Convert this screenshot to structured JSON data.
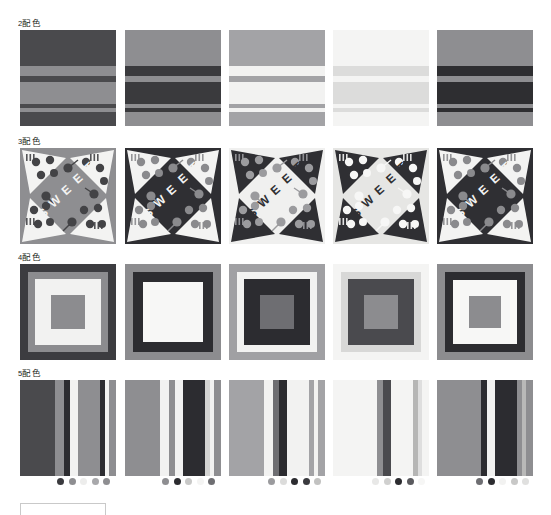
{
  "page": {
    "background": "#ffffff",
    "width": 551,
    "height": 515
  },
  "rows": [
    {
      "id": "row-2colors",
      "label": "2配色",
      "label_number": "2",
      "label_text": "配色",
      "pattern": "horizontal-stripes",
      "top": 18,
      "swatches": [
        {
          "name": "swatch-2c-1",
          "left": 20,
          "palette": [
            "#4a4a4d",
            "#8e8e91"
          ],
          "bands": [
            {
              "top": 0,
              "height": 36,
              "color": "#4a4a4d"
            },
            {
              "top": 36,
              "height": 10,
              "color": "#8e8e91"
            },
            {
              "top": 46,
              "height": 6,
              "color": "#4a4a4d"
            },
            {
              "top": 52,
              "height": 22,
              "color": "#8e8e91"
            },
            {
              "top": 74,
              "height": 4,
              "color": "#4a4a4d"
            },
            {
              "top": 78,
              "height": 4,
              "color": "#8e8e91"
            },
            {
              "top": 82,
              "height": 14,
              "color": "#4a4a4d"
            }
          ]
        },
        {
          "name": "swatch-2c-2",
          "left": 125,
          "palette": [
            "#8e8e91",
            "#3a3a3d"
          ],
          "bands": [
            {
              "top": 0,
              "height": 36,
              "color": "#8e8e91"
            },
            {
              "top": 36,
              "height": 10,
              "color": "#3a3a3d"
            },
            {
              "top": 46,
              "height": 6,
              "color": "#8e8e91"
            },
            {
              "top": 52,
              "height": 22,
              "color": "#3a3a3d"
            },
            {
              "top": 74,
              "height": 4,
              "color": "#8e8e91"
            },
            {
              "top": 78,
              "height": 4,
              "color": "#3a3a3d"
            },
            {
              "top": 82,
              "height": 14,
              "color": "#8e8e91"
            }
          ]
        },
        {
          "name": "swatch-2c-3",
          "left": 229,
          "palette": [
            "#a3a3a6",
            "#f2f2f1"
          ],
          "bands": [
            {
              "top": 0,
              "height": 36,
              "color": "#a3a3a6"
            },
            {
              "top": 36,
              "height": 10,
              "color": "#f2f2f1"
            },
            {
              "top": 46,
              "height": 6,
              "color": "#a3a3a6"
            },
            {
              "top": 52,
              "height": 22,
              "color": "#f2f2f1"
            },
            {
              "top": 74,
              "height": 4,
              "color": "#a3a3a6"
            },
            {
              "top": 78,
              "height": 4,
              "color": "#f2f2f1"
            },
            {
              "top": 82,
              "height": 14,
              "color": "#a3a3a6"
            }
          ]
        },
        {
          "name": "swatch-2c-4",
          "left": 333,
          "palette": [
            "#f4f4f3",
            "#dcdcdb"
          ],
          "bands": [
            {
              "top": 0,
              "height": 36,
              "color": "#f4f4f3"
            },
            {
              "top": 36,
              "height": 10,
              "color": "#dcdcdb"
            },
            {
              "top": 46,
              "height": 6,
              "color": "#f4f4f3"
            },
            {
              "top": 52,
              "height": 22,
              "color": "#dcdcdb"
            },
            {
              "top": 74,
              "height": 4,
              "color": "#f4f4f3"
            },
            {
              "top": 78,
              "height": 4,
              "color": "#dcdcdb"
            },
            {
              "top": 82,
              "height": 14,
              "color": "#f4f4f3"
            }
          ]
        },
        {
          "name": "swatch-2c-5",
          "left": 437,
          "palette": [
            "#8e8e91",
            "#2e2e31"
          ],
          "bands": [
            {
              "top": 0,
              "height": 36,
              "color": "#8e8e91"
            },
            {
              "top": 36,
              "height": 10,
              "color": "#2e2e31"
            },
            {
              "top": 46,
              "height": 6,
              "color": "#8e8e91"
            },
            {
              "top": 52,
              "height": 22,
              "color": "#2e2e31"
            },
            {
              "top": 74,
              "height": 4,
              "color": "#8e8e91"
            },
            {
              "top": 78,
              "height": 4,
              "color": "#2e2e31"
            },
            {
              "top": 82,
              "height": 14,
              "color": "#8e8e91"
            }
          ]
        }
      ]
    },
    {
      "id": "row-3colors",
      "label": "3配色",
      "label_number": "3",
      "label_text": "配色",
      "pattern": "sweet-pinwheel",
      "top": 136,
      "word": "SWEET",
      "swatches": [
        {
          "name": "swatch-3c-1",
          "left": 20,
          "palette": [
            "#8e8e91",
            "#f3f3f2",
            "#434346"
          ],
          "bg": "#8e8e91",
          "wedge": "#f3f3f2",
          "accent": "#434346",
          "word_color": "#f3f3f2"
        },
        {
          "name": "swatch-3c-2",
          "left": 125,
          "palette": [
            "#2f2f33",
            "#f3f3f2",
            "#8a8a8d"
          ],
          "bg": "#2f2f33",
          "wedge": "#f3f3f2",
          "accent": "#8a8a8d",
          "word_color": "#f3f3f2"
        },
        {
          "name": "swatch-3c-3",
          "left": 229,
          "palette": [
            "#f0f0ef",
            "#2f2f33",
            "#9b9b9e"
          ],
          "bg": "#f0f0ef",
          "wedge": "#2f2f33",
          "accent": "#9b9b9e",
          "word_color": "#2f2f33"
        },
        {
          "name": "swatch-3c-4",
          "left": 333,
          "palette": [
            "#e6e6e4",
            "#2f2f33",
            "#f7f7f6"
          ],
          "bg": "#e6e6e4",
          "wedge": "#2f2f33",
          "accent": "#f7f7f6",
          "word_color": "#2f2f33"
        },
        {
          "name": "swatch-3c-5",
          "left": 437,
          "palette": [
            "#2f2f33",
            "#f3f3f2",
            "#8a8a8d"
          ],
          "bg": "#2f2f33",
          "wedge": "#f3f3f2",
          "accent": "#8a8a8d",
          "word_color": "#f3f3f2"
        }
      ]
    },
    {
      "id": "row-4colors",
      "label": "4配色",
      "label_number": "4",
      "label_text": "配色",
      "pattern": "nested-squares",
      "top": 252,
      "swatches": [
        {
          "name": "swatch-4c-1",
          "left": 20,
          "palette": [
            "#3c3c40",
            "#8c8c8f",
            "#f2f2f1",
            "#8c8c8f"
          ],
          "layers": [
            {
              "inset": 0,
              "color": "#3c3c40"
            },
            {
              "inset": 8,
              "color": "#8c8c8f"
            },
            {
              "inset": 15,
              "color": "#f2f2f1"
            },
            {
              "inset": 31,
              "color": "#8c8c8f"
            }
          ]
        },
        {
          "name": "swatch-4c-2",
          "left": 125,
          "palette": [
            "#8c8c8f",
            "#2c2c30",
            "#f7f7f6",
            "#f7f7f6"
          ],
          "layers": [
            {
              "inset": 0,
              "color": "#8c8c8f"
            },
            {
              "inset": 8,
              "color": "#2c2c30"
            },
            {
              "inset": 18,
              "color": "#f7f7f6"
            },
            {
              "inset": 31,
              "color": "#f7f7f6"
            }
          ]
        },
        {
          "name": "swatch-4c-3",
          "left": 229,
          "palette": [
            "#a0a0a3",
            "#f2f2f1",
            "#2c2c30",
            "#6e6e72"
          ],
          "layers": [
            {
              "inset": 0,
              "color": "#a0a0a3"
            },
            {
              "inset": 8,
              "color": "#f2f2f1"
            },
            {
              "inset": 15,
              "color": "#2c2c30"
            },
            {
              "inset": 31,
              "color": "#6e6e72"
            }
          ]
        },
        {
          "name": "swatch-4c-4",
          "left": 333,
          "palette": [
            "#f4f4f3",
            "#d8d8d7",
            "#4a4a4e",
            "#8c8c8f"
          ],
          "layers": [
            {
              "inset": 0,
              "color": "#f4f4f3"
            },
            {
              "inset": 8,
              "color": "#d8d8d7"
            },
            {
              "inset": 15,
              "color": "#4a4a4e"
            },
            {
              "inset": 31,
              "color": "#8c8c8f"
            }
          ]
        },
        {
          "name": "swatch-4c-5",
          "left": 437,
          "palette": [
            "#8c8c8f",
            "#2c2c30",
            "#f7f7f6",
            "#8c8c8f"
          ],
          "layers": [
            {
              "inset": 0,
              "color": "#8c8c8f"
            },
            {
              "inset": 8,
              "color": "#2c2c30"
            },
            {
              "inset": 16,
              "color": "#f7f7f6"
            },
            {
              "inset": 32,
              "color": "#8c8c8f"
            }
          ]
        }
      ]
    },
    {
      "id": "row-5colors",
      "label": "5配色",
      "label_number": "5",
      "label_text": "配色",
      "pattern": "vertical-stripes",
      "top": 368,
      "swatches": [
        {
          "name": "swatch-5c-1",
          "left": 20,
          "palette": [
            "#4a4a4d",
            "#8e8e91",
            "#2c2c30",
            "#f2f2f1",
            "#8e8e91"
          ],
          "bands": [
            {
              "left": 0,
              "width": 35,
              "color": "#4a4a4d"
            },
            {
              "left": 35,
              "width": 9,
              "color": "#8e8e91"
            },
            {
              "left": 44,
              "width": 6,
              "color": "#2c2c30"
            },
            {
              "left": 50,
              "width": 8,
              "color": "#f2f2f1"
            },
            {
              "left": 58,
              "width": 22,
              "color": "#8e8e91"
            },
            {
              "left": 80,
              "width": 5,
              "color": "#2c2c30"
            },
            {
              "left": 85,
              "width": 4,
              "color": "#f2f2f1"
            },
            {
              "left": 89,
              "width": 7,
              "color": "#8e8e91"
            }
          ],
          "dots": [
            "#3a3a3e",
            "#8e8e91",
            "#ededec",
            "#a8a8ab",
            "#8e8e91"
          ],
          "dots_left": 57
        },
        {
          "name": "swatch-5c-2",
          "left": 125,
          "palette": [
            "#8e8e91",
            "#f2f2f1",
            "#2c2c30",
            "#d3d3d2",
            "#8e8e91"
          ],
          "bands": [
            {
              "left": 0,
              "width": 35,
              "color": "#8e8e91"
            },
            {
              "left": 35,
              "width": 9,
              "color": "#f2f2f1"
            },
            {
              "left": 44,
              "width": 6,
              "color": "#8e8e91"
            },
            {
              "left": 50,
              "width": 8,
              "color": "#f2f2f1"
            },
            {
              "left": 58,
              "width": 22,
              "color": "#2c2c30"
            },
            {
              "left": 80,
              "width": 5,
              "color": "#d3d3d2"
            },
            {
              "left": 85,
              "width": 4,
              "color": "#f2f2f1"
            },
            {
              "left": 89,
              "width": 7,
              "color": "#8e8e91"
            }
          ],
          "dots": [
            "#8e8e91",
            "#2c2c30",
            "#c8c8c7",
            "#f4f4f3",
            "#6e6e72"
          ],
          "dots_left": 162
        },
        {
          "name": "swatch-5c-3",
          "left": 229,
          "palette": [
            "#a3a3a6",
            "#6e6e72",
            "#2c2c30",
            "#f2f2f1",
            "#a3a3a6"
          ],
          "bands": [
            {
              "left": 0,
              "width": 35,
              "color": "#a3a3a6"
            },
            {
              "left": 35,
              "width": 9,
              "color": "#f2f2f1"
            },
            {
              "left": 44,
              "width": 6,
              "color": "#6e6e72"
            },
            {
              "left": 50,
              "width": 8,
              "color": "#2c2c30"
            },
            {
              "left": 58,
              "width": 22,
              "color": "#f2f2f1"
            },
            {
              "left": 80,
              "width": 5,
              "color": "#a3a3a6"
            },
            {
              "left": 85,
              "width": 4,
              "color": "#f2f2f1"
            },
            {
              "left": 89,
              "width": 7,
              "color": "#a3a3a6"
            }
          ],
          "dots": [
            "#9b9b9e",
            "#dcdcdb",
            "#2c2c30",
            "#3a3a3e",
            "#c2c2c1"
          ],
          "dots_left": 268
        },
        {
          "name": "swatch-5c-4",
          "left": 333,
          "palette": [
            "#f4f4f3",
            "#e2e2e1",
            "#8e8e91",
            "#2c2c30",
            "#f4f4f3"
          ],
          "bands": [
            {
              "left": 0,
              "width": 35,
              "color": "#f4f4f3"
            },
            {
              "left": 35,
              "width": 9,
              "color": "#f4f4f3"
            },
            {
              "left": 44,
              "width": 6,
              "color": "#8e8e91"
            },
            {
              "left": 50,
              "width": 8,
              "color": "#4a4a4e"
            },
            {
              "left": 58,
              "width": 22,
              "color": "#f4f4f3"
            },
            {
              "left": 80,
              "width": 5,
              "color": "#b6b6b5"
            },
            {
              "left": 85,
              "width": 4,
              "color": "#dedede"
            },
            {
              "left": 89,
              "width": 7,
              "color": "#f4f4f3"
            }
          ],
          "dots": [
            "#e8e8e7",
            "#d0d0cf",
            "#2c2c30",
            "#5a5a5e",
            "#f6f6f5"
          ],
          "dots_left": 372
        },
        {
          "name": "swatch-5c-5",
          "left": 437,
          "palette": [
            "#8e8e91",
            "#2c2c30",
            "#f2f2f1",
            "#2c2c30",
            "#8e8e91"
          ],
          "bands": [
            {
              "left": 0,
              "width": 35,
              "color": "#8e8e91"
            },
            {
              "left": 35,
              "width": 9,
              "color": "#8e8e91"
            },
            {
              "left": 44,
              "width": 6,
              "color": "#2c2c30"
            },
            {
              "left": 50,
              "width": 8,
              "color": "#f2f2f1"
            },
            {
              "left": 58,
              "width": 22,
              "color": "#2c2c30"
            },
            {
              "left": 80,
              "width": 5,
              "color": "#8e8e91"
            },
            {
              "left": 85,
              "width": 4,
              "color": "#b9b9b8"
            },
            {
              "left": 89,
              "width": 7,
              "color": "#8e8e91"
            }
          ],
          "dots": [
            "#6e6e72",
            "#2c2c30",
            "#f2f2f1",
            "#c8c8c7",
            "#e0e0df"
          ],
          "dots_left": 476
        }
      ]
    }
  ]
}
